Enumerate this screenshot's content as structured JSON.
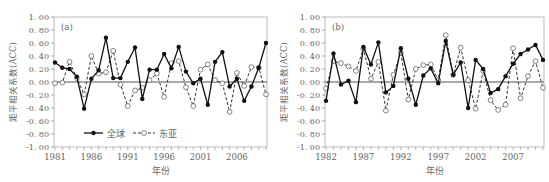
{
  "chart_data": [
    {
      "type": "line",
      "panel_label": "(a)",
      "xlabel": "年份",
      "ylabel": "距平相关系数(ACC)",
      "ylim": [
        -1.0,
        1.0
      ],
      "yticks": [
        "1.00",
        "0.80",
        "0.60",
        "0.40",
        "0.20",
        "0.00",
        "-0.20",
        "-0.40",
        "-0.60",
        "-0.80",
        "-1.00"
      ],
      "xtick_labels": [
        "1981",
        "1986",
        "1991",
        "1996",
        "2001",
        "2006"
      ],
      "x": [
        1981,
        1982,
        1983,
        1984,
        1985,
        1986,
        1987,
        1988,
        1989,
        1990,
        1991,
        1992,
        1993,
        1994,
        1995,
        1996,
        1997,
        1998,
        1999,
        2000,
        2001,
        2002,
        2003,
        2004,
        2005,
        2006,
        2007,
        2008,
        2009,
        2010
      ],
      "legend_position": "lower-left-inside",
      "series": [
        {
          "name": "全球",
          "style": "solid-filled",
          "values": [
            0.3,
            0.22,
            0.2,
            0.08,
            -0.41,
            0.05,
            0.18,
            0.68,
            0.06,
            0.06,
            0.31,
            0.53,
            -0.26,
            0.19,
            0.19,
            0.43,
            0.21,
            0.54,
            0.16,
            -0.02,
            0.05,
            -0.35,
            0.31,
            0.46,
            -0.07,
            0.05,
            -0.29,
            -0.07,
            0.22,
            0.6
          ]
        },
        {
          "name": "东亚",
          "style": "dashed-open",
          "values": [
            -0.02,
            -0.01,
            0.31,
            0.06,
            -0.19,
            0.4,
            0.13,
            0.15,
            0.48,
            -0.04,
            -0.37,
            -0.13,
            -0.09,
            0.03,
            0.13,
            -0.23,
            0.29,
            0.32,
            -0.08,
            -0.37,
            0.19,
            0.27,
            0.03,
            -0.02,
            -0.46,
            0.14,
            -0.06,
            0.23,
            0.22,
            -0.19
          ]
        }
      ]
    },
    {
      "type": "line",
      "panel_label": "(b)",
      "xlabel": "年份",
      "ylabel": "距平相关系数(ACC)",
      "ylim": [
        -1.0,
        1.0
      ],
      "yticks": [
        "1.00",
        "0.80",
        "0.60",
        "0.40",
        "0.20",
        "0.00",
        "-0.20",
        "-0.40",
        "-0.60",
        "-0.80",
        "-1.00"
      ],
      "xtick_labels": [
        "1982",
        "1987",
        "1992",
        "1997",
        "2002",
        "2007"
      ],
      "x": [
        1982,
        1983,
        1984,
        1985,
        1986,
        1987,
        1988,
        1989,
        1990,
        1991,
        1992,
        1993,
        1994,
        1995,
        1996,
        1997,
        1998,
        1999,
        2000,
        2001,
        2002,
        2003,
        2004,
        2005,
        2006,
        2007,
        2008,
        2009,
        2010,
        2011
      ],
      "series": [
        {
          "name": "全球",
          "style": "solid-filled",
          "values": [
            -0.29,
            0.44,
            -0.04,
            0.02,
            -0.31,
            0.54,
            0.27,
            0.61,
            -0.16,
            -0.06,
            0.52,
            0.05,
            -0.35,
            0.1,
            0.21,
            -0.02,
            0.63,
            0.11,
            0.3,
            -0.4,
            0.34,
            0.2,
            -0.17,
            -0.11,
            0.09,
            0.28,
            0.43,
            0.5,
            0.57,
            0.34
          ]
        },
        {
          "name": "东亚",
          "style": "dashed-open",
          "values": [
            -0.1,
            0.32,
            0.29,
            0.24,
            0.17,
            0.51,
            0.05,
            0.31,
            -0.44,
            0.11,
            0.45,
            -0.27,
            0.2,
            0.26,
            0.27,
            0.03,
            0.72,
            0.11,
            0.53,
            0.03,
            -0.41,
            0.17,
            -0.28,
            -0.43,
            -0.35,
            0.52,
            -0.25,
            0.09,
            0.32,
            -0.09
          ]
        }
      ]
    }
  ]
}
